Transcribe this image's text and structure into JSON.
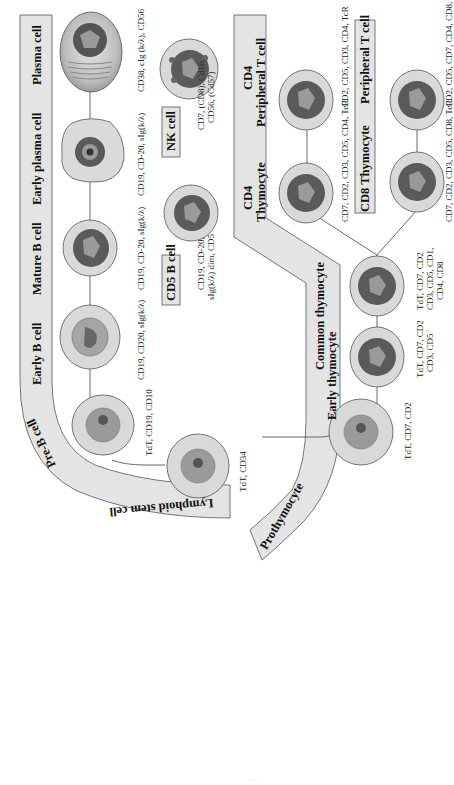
{
  "figure": {
    "orientation": "rotated-90-ccw",
    "colors": {
      "band_fill": "#e4e4e4",
      "band_stroke": "#555555",
      "cytoplasm": "#d9d9d9",
      "nucleus_dark": "#5a5a5a",
      "nucleus_light": "#9a9a9a",
      "connector": "#444444"
    }
  },
  "bands": {
    "b_lineage": {
      "labels": {
        "stem": "Lymphoid stem cell",
        "pre_b": "Pre-B cell",
        "early_b": "Early B cell",
        "mature_b": "Mature B cell",
        "early_plasma": "Early plasma cell",
        "plasma": "Plasma cell"
      }
    },
    "t_lineage": {
      "labels": {
        "prothymocyte": "Prothymocyte",
        "early_thymocyte": "Early thymocyte",
        "common_thymocyte": "Common thymocyte",
        "cd4_thymocyte_line1": "CD4",
        "cd4_thymocyte_line2": "Thymocyte",
        "cd4_peripheral_line1": "CD4",
        "cd4_peripheral_line2": "Peripheral T cell"
      }
    }
  },
  "boxes": {
    "nk_cell": "NK cell",
    "cd5_b_cell": "CD5 B cell",
    "cd8_thymocyte": "CD8 Thymocyte",
    "cd8_peripheral": "Peripheral T cell"
  },
  "cells": [
    {
      "id": "lymphoid-stem-cell",
      "markers": [
        "TdT, CD34"
      ]
    },
    {
      "id": "pre-b-cell",
      "markers": [
        "TdT, CD19, CD10"
      ]
    },
    {
      "id": "early-b-cell",
      "markers": [
        "CD19, CD20, sIg(k/λ)"
      ]
    },
    {
      "id": "mature-b-cell",
      "markers": [
        "CD19, CD-20, sIg(k/λ)"
      ]
    },
    {
      "id": "early-plasma-cell",
      "markers": [
        "CD19, CD-20, sIg(k/λ)"
      ]
    },
    {
      "id": "plasma-cell",
      "markers": [
        "CD38, cIg  (k/λ), CD56"
      ]
    },
    {
      "id": "cd5-b-cell",
      "markers": [
        "CD19, CD-20,",
        "sIg(k/λ) dim, CD5"
      ]
    },
    {
      "id": "nk-cell",
      "markers": [
        "CD7, (CD8), Cd16,",
        "CD56, (Cd57)"
      ]
    },
    {
      "id": "prothymocyte",
      "markers": [
        "TdT, CD7, CD2"
      ]
    },
    {
      "id": "early-thymocyte",
      "markers": [
        "TdT, CD7, CD2",
        "CD3, CD5"
      ]
    },
    {
      "id": "common-thymocyte",
      "markers": [
        "TdT, CD7, CD2",
        "CD3, CD5, CD1,",
        "CD4,  CD8"
      ]
    },
    {
      "id": "cd4-thymocyte",
      "markers": [
        "CD7, CD2, CD3, CD5, CD4, TcR"
      ]
    },
    {
      "id": "cd4-peripheral-t-cell",
      "markers": [
        "CD2, CD5, CD3, CD4, TcR"
      ]
    },
    {
      "id": "cd8-thymocyte",
      "markers": [
        "CD7, CD2, CD3, CD5, CD8, TcR"
      ]
    },
    {
      "id": "cd8-peripheral-t-cell",
      "markers": [
        "CD2, CD5, CD7, CD4, CD8, TcR"
      ]
    }
  ]
}
